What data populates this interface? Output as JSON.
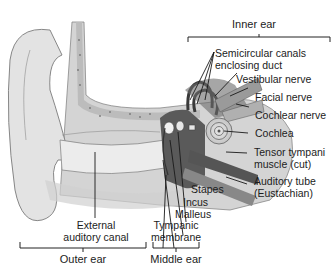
{
  "figure": {
    "regions": {
      "inner_ear": "Inner ear",
      "outer_ear": "Outer ear",
      "middle_ear": "Middle ear"
    },
    "labels": {
      "semicircular_1": "Semicircular canals",
      "semicircular_2": "enclosing duct",
      "vestibular_nerve": "Vestibular nerve",
      "facial_nerve": "Facial nerve",
      "cochlear_nerve": "Cochlear nerve",
      "cochlea": "Cochlea",
      "tensor_1": "Tensor tympani",
      "tensor_2": "muscle (cut)",
      "auditory_tube_1": "Auditory tube",
      "auditory_tube_2": "(Eustachian)",
      "stapes": "Stapes",
      "incus": "Incus",
      "malleus": "Malleus",
      "tympanic_1": "Tympanic",
      "tympanic_2": "membrane",
      "external_1": "External",
      "external_2": "auditory canal"
    },
    "colors": {
      "skin": "#dedede",
      "bone": "#c9c9c9",
      "dark": "#4a4a4a",
      "line": "#222222"
    }
  }
}
